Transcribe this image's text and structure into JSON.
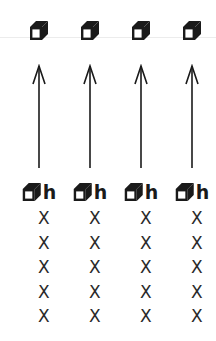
{
  "diagram": {
    "type": "vertical-arrows-columns",
    "divider_color": "#ececec",
    "stroke_color": "#1a1a1a",
    "columns": [
      {
        "top_icon": "cube-icon",
        "arrow_direction": "up",
        "bottom_icon": "cube-icon",
        "bottom_label": "h",
        "marks": [
          "X",
          "X",
          "X",
          "X",
          "X"
        ]
      },
      {
        "top_icon": "cube-icon",
        "arrow_direction": "up",
        "bottom_icon": "cube-icon",
        "bottom_label": "h",
        "marks": [
          "X",
          "X",
          "X",
          "X",
          "X"
        ]
      },
      {
        "top_icon": "cube-icon",
        "arrow_direction": "up",
        "bottom_icon": "cube-icon",
        "bottom_label": "h",
        "marks": [
          "X",
          "X",
          "X",
          "X",
          "X"
        ]
      },
      {
        "top_icon": "cube-icon",
        "arrow_direction": "up",
        "bottom_icon": "cube-icon",
        "bottom_label": "h",
        "marks": [
          "X",
          "X",
          "X",
          "X",
          "X"
        ]
      }
    ]
  }
}
